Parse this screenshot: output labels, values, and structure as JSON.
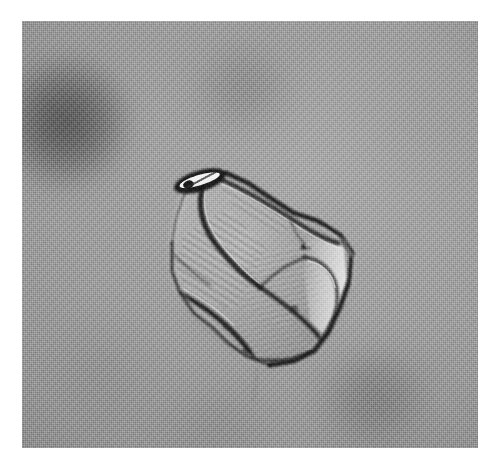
{
  "figure": {
    "kind": "photomicrograph",
    "caption": "",
    "plate": {
      "left": 22,
      "top": 21,
      "width": 456,
      "height": 427,
      "page_background": "#ffffff",
      "field_background": "#9c9c9c",
      "print_style": "halftone-screened grayscale"
    }
  },
  "palette": {
    "page_white": "#ffffff",
    "field_mid_gray": "#9c9c9c",
    "field_light_gray": "#a8a8a8",
    "field_dark_gray": "#8d8d8d",
    "particle_body": "#a5a5a5",
    "particle_shadow": "#5a5a5a",
    "particle_edge_dark": "#1e1e1e",
    "particle_highlight": "#ebebeb",
    "debris_dark": "#3c3c3c"
  },
  "scene": {
    "subject_name": "angular-particle",
    "subject_description": "single irregular angular translucent grain",
    "field_description": "uniform out-of-focus gray background with soft dark debris",
    "illumination": "brightfield / phase-contrast transmitted light",
    "focus": "subject in focus, background blurred"
  },
  "background_blobs": [
    {
      "name": "debris-blob-upper-left",
      "cx": 40,
      "cy": 100,
      "rx": 66,
      "ry": 64,
      "tone": "dark"
    },
    {
      "name": "debris-blob-top-center",
      "cx": 221,
      "cy": 66,
      "rx": 63,
      "ry": 46,
      "tone": "faint-dark"
    },
    {
      "name": "debris-blob-lower-right",
      "cx": 356,
      "cy": 379,
      "rx": 64,
      "ry": 49,
      "tone": "faint-dark"
    },
    {
      "name": "debris-blob-lower-left",
      "cx": 78,
      "cy": 355,
      "rx": 60,
      "ry": 55,
      "tone": "very-faint"
    },
    {
      "name": "halo-blob-upper-right",
      "cx": 398,
      "cy": 105,
      "rx": 48,
      "ry": 45,
      "tone": "light"
    },
    {
      "name": "smudge-bottom-center",
      "cx": 195,
      "cy": 405,
      "rx": 75,
      "ry": 35,
      "tone": "very-faint"
    }
  ],
  "particle": {
    "name": "angular-particle",
    "bounding_box": {
      "x": 126,
      "y": 140,
      "width": 208,
      "height": 215
    },
    "centroid": {
      "x": 232,
      "y": 248
    },
    "outline_points": "160,180 168,160 186,150 204,152 226,162 250,178 272,192 296,200 318,214 330,232 328,258 318,286 306,312 292,330 272,340 248,344 226,336 206,322 190,306 172,292 158,272 150,250 150,222 154,198",
    "features": [
      {
        "name": "apex-notch",
        "description": "dark lens-shaped notch with bright white core at upper-left apex",
        "x": 178,
        "y": 160
      },
      {
        "name": "upper-ridge-facet",
        "description": "striated facet running down-right from apex",
        "x": 228,
        "y": 176
      },
      {
        "name": "left-striated-facet",
        "description": "diagonal parallel striations on left-central body",
        "x": 190,
        "y": 238
      },
      {
        "name": "central-cleft",
        "description": "dark crack descending from apex to centre",
        "x": 214,
        "y": 250
      },
      {
        "name": "right-bright-facet",
        "description": "bright highlighted facet along right margin",
        "x": 300,
        "y": 268
      },
      {
        "name": "lower-right-lobe",
        "description": "rounded lobe with dark rim at lower right",
        "x": 288,
        "y": 310
      },
      {
        "name": "basal-edge",
        "description": "dark basal boundary across the bottom",
        "x": 228,
        "y": 336
      },
      {
        "name": "left-margin-edge",
        "description": "thin dark contour defining the left margin",
        "x": 152,
        "y": 250
      }
    ]
  }
}
